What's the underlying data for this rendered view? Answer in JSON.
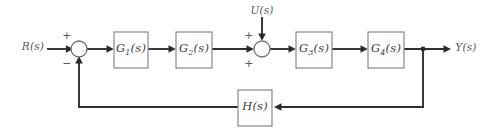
{
  "diagram": {
    "type": "control-system-block-diagram",
    "canvas": {
      "width": 489,
      "height": 133,
      "background": "#ffffff"
    },
    "colors": {
      "wire": "#2f2f33",
      "block_border": "#8e8e93",
      "block_fill": "#fefefe",
      "label_text": "#4a4a50",
      "sum_circle_border": "#6f6f75"
    },
    "signals": {
      "reference_input": "R(s)",
      "disturbance_input": "U(s)",
      "output": "Y(s)"
    },
    "blocks": [
      {
        "id": "g1",
        "label_base": "G",
        "label_sub": "1",
        "label_suffix": "(s)",
        "label_full": "G1(s)",
        "x": 114,
        "y": 32,
        "width": 34,
        "height": 36
      },
      {
        "id": "g2",
        "label_base": "G",
        "label_sub": "2",
        "label_suffix": "(s)",
        "label_full": "G2(s)",
        "x": 176,
        "y": 32,
        "width": 36,
        "height": 36
      },
      {
        "id": "g3",
        "label_base": "G",
        "label_sub": "3",
        "label_suffix": "(s)",
        "label_full": "G3(s)",
        "x": 296,
        "y": 32,
        "width": 36,
        "height": 36
      },
      {
        "id": "g4",
        "label_base": "G",
        "label_sub": "4",
        "label_suffix": "(s)",
        "label_full": "G4(s)",
        "x": 368,
        "y": 32,
        "width": 36,
        "height": 36
      },
      {
        "id": "h",
        "label_base": "H",
        "label_sub": "",
        "label_suffix": "(s)",
        "label_full": "H(s)",
        "x": 238,
        "y": 90,
        "width": 34,
        "height": 36
      }
    ],
    "summing_junctions": [
      {
        "id": "sum1",
        "cx": 79,
        "cy": 49,
        "r": 8,
        "signs": [
          {
            "symbol": "+",
            "position": "top-left",
            "x": 67,
            "y": 35,
            "for_input": "R(s)"
          },
          {
            "symbol": "−",
            "position": "bottom-left",
            "x": 67,
            "y": 63,
            "for_input": "feedback"
          }
        ]
      },
      {
        "id": "sum2",
        "cx": 262,
        "cy": 49,
        "r": 8,
        "signs": [
          {
            "symbol": "+",
            "position": "top-left",
            "x": 249,
            "y": 35,
            "for_input": "U(s)"
          },
          {
            "symbol": "+",
            "position": "bottom-left",
            "x": 249,
            "y": 63,
            "for_input": "forward-path"
          }
        ]
      }
    ],
    "nodes": [
      {
        "id": "takeoff",
        "label": "output-takeoff-point",
        "x": 423,
        "y": 49
      }
    ],
    "labels": [
      {
        "id": "r-label",
        "text": "R(s)",
        "x": 33,
        "y": 46
      },
      {
        "id": "u-label",
        "text": "U(s)",
        "x": 262,
        "y": 10
      },
      {
        "id": "y-label",
        "text": "Y(s)",
        "x": 466,
        "y": 47
      }
    ],
    "forward_path_order": [
      "R(s)",
      "sum1",
      "G1(s)",
      "G2(s)",
      "sum2",
      "G3(s)",
      "G4(s)",
      "Y(s)"
    ],
    "feedback_path_order": [
      "takeoff",
      "H(s)",
      "sum1"
    ]
  }
}
